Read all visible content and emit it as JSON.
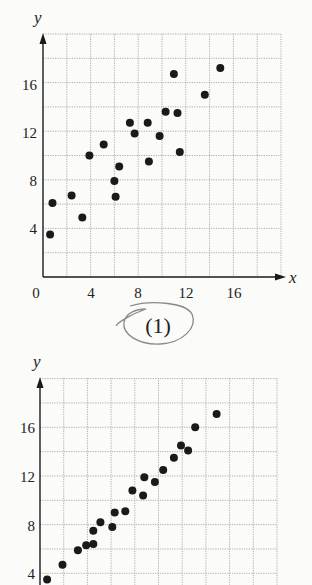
{
  "page": {
    "background": "#fbfbfa",
    "ink": "#1a1a1a",
    "grid_color": "#9a9a9a",
    "annotation_color": "#8a8a8a"
  },
  "figures": [
    {
      "id": "plot-1",
      "caption": "(1)",
      "caption_circled": true,
      "xlabel": "x",
      "ylabel": "y",
      "x_ticks": [
        "0",
        "4",
        "8",
        "12",
        "16"
      ],
      "y_ticks": [
        "4",
        "8",
        "12",
        "16"
      ]
    },
    {
      "id": "plot-2",
      "caption": "",
      "xlabel": "",
      "ylabel": "y",
      "x_ticks": [],
      "y_ticks": [
        "4",
        "8",
        "12",
        "16"
      ]
    }
  ],
  "chart_data": [
    {
      "type": "scatter",
      "title": "(1)",
      "xlabel": "x",
      "ylabel": "y",
      "xlim": [
        0,
        20
      ],
      "ylim": [
        0,
        20
      ],
      "x_ticks": [
        0,
        4,
        8,
        12,
        16
      ],
      "y_ticks": [
        4,
        8,
        12,
        16
      ],
      "grid": true,
      "grid_step": 2,
      "legend": "none",
      "series": [
        {
          "name": "points",
          "x": [
            0.6,
            0.8,
            2.4,
            3.3,
            3.9,
            5.1,
            6.0,
            6.1,
            6.4,
            7.3,
            7.7,
            8.8,
            8.9,
            9.8,
            10.3,
            11.0,
            11.3,
            11.5,
            13.6,
            14.9
          ],
          "y": [
            3.5,
            6.1,
            6.7,
            4.9,
            10.0,
            10.9,
            7.9,
            6.6,
            9.1,
            12.7,
            11.8,
            12.7,
            9.5,
            11.6,
            13.6,
            16.7,
            13.5,
            10.3,
            15.0,
            17.2
          ]
        }
      ]
    },
    {
      "type": "scatter",
      "title": "",
      "xlabel": "",
      "ylabel": "y",
      "xlim": [
        0,
        20
      ],
      "ylim": [
        0,
        20
      ],
      "x_ticks": [],
      "y_ticks": [
        4,
        8,
        12,
        16
      ],
      "grid": true,
      "grid_step": 2,
      "legend": "none",
      "note": "figure cropped at bottom edge; x-axis not visible",
      "series": [
        {
          "name": "points",
          "x": [
            0.6,
            1.9,
            3.2,
            3.9,
            4.5,
            4.5,
            5.1,
            6.1,
            6.3,
            7.2,
            7.8,
            8.7,
            8.8,
            9.7,
            10.4,
            11.3,
            11.9,
            12.5,
            13.1,
            14.9
          ],
          "y": [
            3.5,
            4.7,
            5.9,
            6.3,
            6.4,
            7.5,
            8.2,
            7.8,
            9.0,
            9.1,
            10.8,
            10.4,
            11.9,
            11.5,
            12.5,
            13.5,
            14.5,
            14.1,
            16.0,
            17.1
          ]
        }
      ]
    }
  ]
}
